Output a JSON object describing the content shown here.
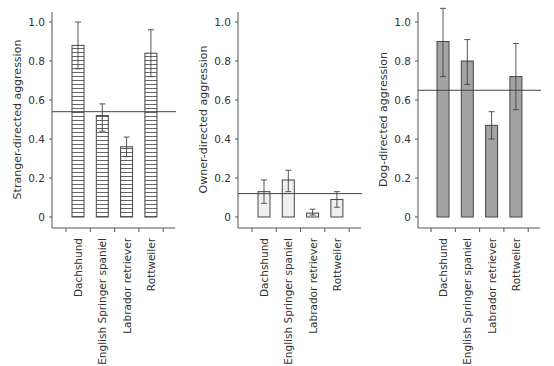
{
  "chart_data": [
    {
      "type": "bar",
      "title": "",
      "xlabel": "",
      "ylabel": "Stranger-directed aggression",
      "categories": [
        "Dachshund",
        "English Springer spaniel",
        "Labrador retriever",
        "Rottweiler"
      ],
      "values": [
        0.88,
        0.52,
        0.36,
        0.84
      ],
      "error_low": [
        0.76,
        0.44,
        0.31,
        0.72
      ],
      "error_high": [
        1.0,
        0.58,
        0.41,
        0.96
      ],
      "reference_line": 0.54,
      "ylim": [
        0,
        1.0
      ],
      "yticks": [
        "0",
        "0.2",
        "0.4",
        "0.6",
        "0.8",
        "1.0"
      ],
      "fill": "horizontal-hatch",
      "grid": false,
      "legend": "none"
    },
    {
      "type": "bar",
      "title": "",
      "xlabel": "",
      "ylabel": "Owner-directed aggression",
      "categories": [
        "Dachshund",
        "English Springer spaniel",
        "Labrador retriever",
        "Rottweiler"
      ],
      "values": [
        0.13,
        0.19,
        0.02,
        0.09
      ],
      "error_low": [
        0.07,
        0.13,
        0.01,
        0.05
      ],
      "error_high": [
        0.19,
        0.24,
        0.04,
        0.13
      ],
      "reference_line": 0.12,
      "ylim": [
        0,
        1.0
      ],
      "yticks": [
        "0",
        "0.2",
        "0.4",
        "0.6",
        "0.8",
        "1.0"
      ],
      "fill": "#efefef",
      "grid": false,
      "legend": "none"
    },
    {
      "type": "bar",
      "title": "",
      "xlabel": "",
      "ylabel": "Dog-directed aggression",
      "categories": [
        "Dachshund",
        "English Springer spaniel",
        "Labrador retriever",
        "Rottweiler"
      ],
      "values": [
        0.9,
        0.8,
        0.47,
        0.72
      ],
      "error_low": [
        0.72,
        0.68,
        0.4,
        0.55
      ],
      "error_high": [
        1.07,
        0.91,
        0.54,
        0.89
      ],
      "reference_line": 0.65,
      "ylim": [
        0,
        1.0
      ],
      "yticks": [
        "0",
        "0.2",
        "0.4",
        "0.6",
        "0.8",
        "1.0"
      ],
      "fill": "#a3a3a3",
      "grid": false,
      "legend": "none"
    }
  ]
}
